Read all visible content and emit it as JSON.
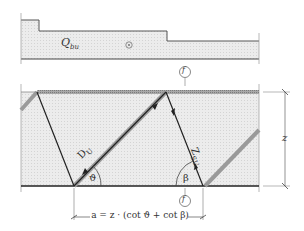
{
  "diagram": {
    "type": "truss-model",
    "labels": {
      "shear_force": "Q",
      "shear_force_sub": "bu",
      "strut": "D",
      "strut_sub": "U",
      "tie": "Z",
      "tie_sub": "SU",
      "theta": "ϑ",
      "beta": "β",
      "section_marker_top": "f",
      "section_marker_bottom": "f",
      "height": "z",
      "spacing_formula": "a = z · (cot ϑ + cot β)"
    },
    "colors": {
      "fill": "#e9e9e9",
      "line": "#222222",
      "hatch": "#9a9a9a",
      "text": "#333333"
    }
  }
}
